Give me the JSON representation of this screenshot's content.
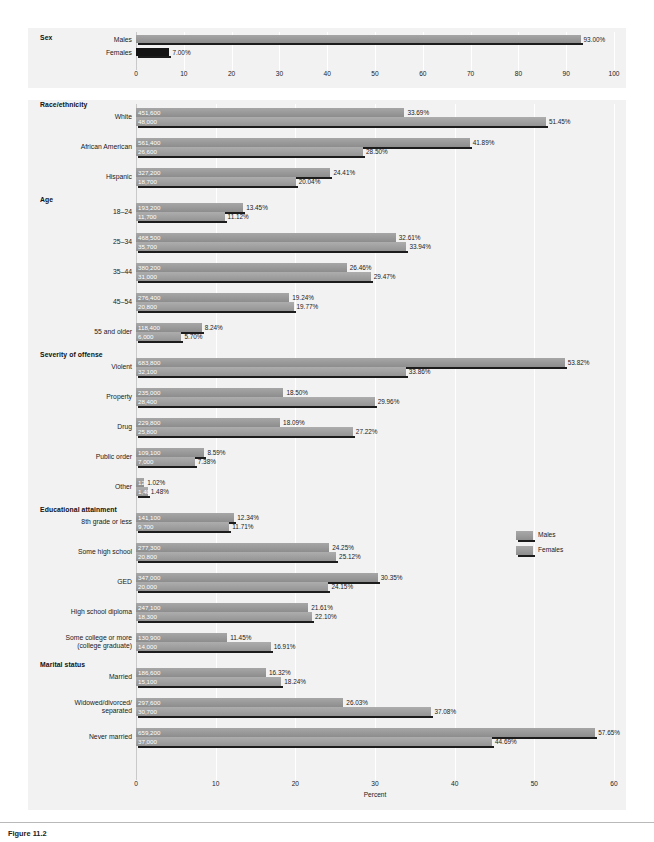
{
  "figure": {
    "caption": "Figure 11.2"
  },
  "legend": {
    "position": "right-middle",
    "items": [
      {
        "label": "Males",
        "color": "#9c9c9c"
      },
      {
        "label": "Females",
        "color": "#a2a2a2"
      }
    ]
  },
  "chart_data": {
    "type": "bar",
    "orientation": "horizontal",
    "title": "",
    "xlabel": "Percent",
    "ylabel": "",
    "grid": true,
    "series_names": [
      "Males",
      "Females"
    ],
    "panels": [
      {
        "name": "sex-panel",
        "group": "Sex",
        "xlim": [
          0,
          100
        ],
        "xticks": [
          0,
          10,
          20,
          30,
          40,
          50,
          60,
          70,
          80,
          90,
          100
        ],
        "xlabel": "",
        "categories": [
          "Males",
          "Females"
        ],
        "rows": [
          {
            "label": "Males",
            "percent": 93.0,
            "percent_label": "93.00%",
            "count_label": "",
            "style": "male"
          },
          {
            "label": "Females",
            "percent": 7.0,
            "percent_label": "7.00%",
            "count_label": "",
            "style": "solid"
          }
        ]
      },
      {
        "name": "main-panel",
        "xlim": [
          0,
          60
        ],
        "xticks": [
          0,
          10,
          20,
          30,
          40,
          50,
          60
        ],
        "xlabel": "Percent",
        "groups": [
          {
            "heading": "Race/ethnicity",
            "rows": [
              {
                "label": "White",
                "male": {
                  "count": "451,600",
                  "percent": 33.69,
                  "percent_label": "33.69%"
                },
                "female": {
                  "count": "48,000",
                  "percent": 51.45,
                  "percent_label": "51.45%"
                }
              },
              {
                "label": "African American",
                "male": {
                  "count": "561,400",
                  "percent": 41.89,
                  "percent_label": "41.89%"
                },
                "female": {
                  "count": "26,600",
                  "percent": 28.5,
                  "percent_label": "28.50%"
                }
              },
              {
                "label": "Hispanic",
                "male": {
                  "count": "327,200",
                  "percent": 24.41,
                  "percent_label": "24.41%"
                },
                "female": {
                  "count": "18,700",
                  "percent": 20.04,
                  "percent_label": "20.04%"
                }
              }
            ]
          },
          {
            "heading": "Age",
            "rows": [
              {
                "label": "18–24",
                "male": {
                  "count": "193,200",
                  "percent": 13.45,
                  "percent_label": "13.45%"
                },
                "female": {
                  "count": "11,700",
                  "percent": 11.12,
                  "percent_label": "11.12%"
                }
              },
              {
                "label": "25–34",
                "male": {
                  "count": "468,500",
                  "percent": 32.61,
                  "percent_label": "32.61%"
                },
                "female": {
                  "count": "35,700",
                  "percent": 33.94,
                  "percent_label": "33.94%"
                }
              },
              {
                "label": "35–44",
                "male": {
                  "count": "380,200",
                  "percent": 26.46,
                  "percent_label": "26.46%"
                },
                "female": {
                  "count": "31,000",
                  "percent": 29.47,
                  "percent_label": "29.47%"
                }
              },
              {
                "label": "45–54",
                "male": {
                  "count": "276,400",
                  "percent": 19.24,
                  "percent_label": "19.24%"
                },
                "female": {
                  "count": "20,800",
                  "percent": 19.77,
                  "percent_label": "19.77%"
                }
              },
              {
                "label": "55 and older",
                "male": {
                  "count": "118,400",
                  "percent": 8.24,
                  "percent_label": "8.24%"
                },
                "female": {
                  "count": "6,000",
                  "percent": 5.7,
                  "percent_label": "5.70%"
                }
              }
            ]
          },
          {
            "heading": "Severity of offense",
            "rows": [
              {
                "label": "Violent",
                "male": {
                  "count": "683,800",
                  "percent": 53.82,
                  "percent_label": "53.82%"
                },
                "female": {
                  "count": "32,100",
                  "percent": 33.86,
                  "percent_label": "33.86%"
                }
              },
              {
                "label": "Property",
                "male": {
                  "count": "235,000",
                  "percent": 18.5,
                  "percent_label": "18.50%"
                },
                "female": {
                  "count": "28,400",
                  "percent": 29.96,
                  "percent_label": "29.96%"
                }
              },
              {
                "label": "Drug",
                "male": {
                  "count": "229,800",
                  "percent": 18.09,
                  "percent_label": "18.09%"
                },
                "female": {
                  "count": "25,800",
                  "percent": 27.22,
                  "percent_label": "27.22%"
                }
              },
              {
                "label": "Public order",
                "male": {
                  "count": "109,100",
                  "percent": 8.59,
                  "percent_label": "8.59%"
                },
                "female": {
                  "count": "7,000",
                  "percent": 7.38,
                  "percent_label": "7.38%"
                }
              },
              {
                "label": "Other",
                "male": {
                  "count": "12,900",
                  "percent": 1.02,
                  "percent_label": "1.02%"
                },
                "female": {
                  "count": "1,400",
                  "percent": 1.48,
                  "percent_label": "1.48%"
                }
              }
            ]
          },
          {
            "heading": "Educational attainment",
            "rows": [
              {
                "label": "8th grade or less",
                "male": {
                  "count": "141,100",
                  "percent": 12.34,
                  "percent_label": "12.34%"
                },
                "female": {
                  "count": "9,700",
                  "percent": 11.71,
                  "percent_label": "11.71%"
                }
              },
              {
                "label": "Some high school",
                "male": {
                  "count": "277,300",
                  "percent": 24.25,
                  "percent_label": "24.25%"
                },
                "female": {
                  "count": "20,800",
                  "percent": 25.12,
                  "percent_label": "25.12%"
                }
              },
              {
                "label": "GED",
                "male": {
                  "count": "347,000",
                  "percent": 30.35,
                  "percent_label": "30.35%"
                },
                "female": {
                  "count": "20,000",
                  "percent": 24.15,
                  "percent_label": "24.15%"
                }
              },
              {
                "label": "High school diploma",
                "male": {
                  "count": "247,100",
                  "percent": 21.61,
                  "percent_label": "21.61%"
                },
                "female": {
                  "count": "18,300",
                  "percent": 22.1,
                  "percent_label": "22.10%"
                }
              },
              {
                "label": "Some college or more\n(college graduate)",
                "male": {
                  "count": "130,900",
                  "percent": 11.45,
                  "percent_label": "11.45%"
                },
                "female": {
                  "count": "14,000",
                  "percent": 16.91,
                  "percent_label": "16.91%"
                }
              }
            ]
          },
          {
            "heading": "Marital status",
            "rows": [
              {
                "label": "Married",
                "male": {
                  "count": "186,600",
                  "percent": 16.32,
                  "percent_label": "16.32%"
                },
                "female": {
                  "count": "15,100",
                  "percent": 18.24,
                  "percent_label": "18.24%"
                }
              },
              {
                "label": "Widowed/divorced/\nseparated",
                "male": {
                  "count": "297,600",
                  "percent": 26.03,
                  "percent_label": "26.03%"
                },
                "female": {
                  "count": "30,700",
                  "percent": 37.08,
                  "percent_label": "37.08%"
                }
              },
              {
                "label": "Never married",
                "male": {
                  "count": "659,200",
                  "percent": 57.65,
                  "percent_label": "57.65%"
                },
                "female": {
                  "count": "37,000",
                  "percent": 44.69,
                  "percent_label": "44.69%"
                }
              }
            ]
          }
        ]
      }
    ]
  }
}
